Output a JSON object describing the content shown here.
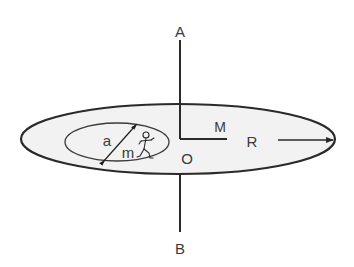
{
  "diagram": {
    "labels": {
      "axis_top": "A",
      "axis_bottom": "B",
      "center": "O",
      "disk_mass": "M",
      "disk_radius": "R",
      "circle_diameter": "a",
      "person_mass": "m"
    },
    "colors": {
      "stroke": "#2a2a2a",
      "disk_fill": "#f2f2f2",
      "text": "#3a3a3a"
    },
    "elements": {
      "outer_disk": "large flat disk of mass M and radius R, viewed in perspective",
      "axis": "vertical axis AB through center O",
      "inner_path": "circular track of diameter a on the disk",
      "person": "person of mass m walking along the inner circle"
    }
  }
}
